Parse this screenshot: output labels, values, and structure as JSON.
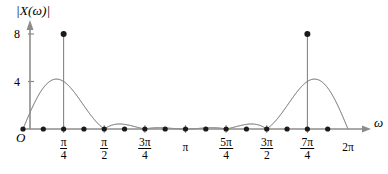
{
  "figure": {
    "title": "",
    "y_axis_label": "|X(ω)|",
    "x_axis_label": "ω",
    "origin_label": "O",
    "colors": {
      "axis": "#8c8c8c",
      "curve": "#4d4d4d",
      "marker": "#1a1a1a",
      "stem": "#7a7a7a",
      "text": "#000000",
      "background": "#ffffff"
    },
    "y_ticks": [
      {
        "label": "8",
        "value": 8
      },
      {
        "label": "4",
        "value": 4
      }
    ],
    "x_ticks": [
      {
        "label_type": "fraction",
        "num": "π",
        "den": "4",
        "value": 0.25
      },
      {
        "label_type": "fraction",
        "num": "π",
        "den": "2",
        "value": 0.5
      },
      {
        "label_type": "fraction",
        "num": "3π",
        "den": "4",
        "value": 0.75
      },
      {
        "label_type": "plain",
        "text": "π",
        "value": 1.0
      },
      {
        "label_type": "fraction",
        "num": "5π",
        "den": "4",
        "value": 1.25
      },
      {
        "label_type": "fraction",
        "num": "3π",
        "den": "2",
        "value": 1.5
      },
      {
        "label_type": "fraction",
        "num": "7π",
        "den": "4",
        "value": 1.75
      },
      {
        "label_type": "plain",
        "text": "2π",
        "value": 2.0
      }
    ]
  },
  "chart_data": {
    "type": "line",
    "title": "",
    "xlabel": "ω",
    "ylabel": "|X(ω)|",
    "xlim": [
      0,
      2.0
    ],
    "ylim": [
      0,
      9.2
    ],
    "grid": false,
    "legend": null,
    "x_unit": "π radians",
    "main_lobe_peaks": [
      {
        "x": 0.25,
        "y": 8,
        "x_label": "π/4"
      },
      {
        "x": 1.75,
        "y": 8,
        "x_label": "7π/4"
      }
    ],
    "zero_crossings_x": [
      0,
      0.125,
      0.375,
      0.5,
      0.625,
      0.75,
      0.875,
      1.0,
      1.125,
      1.25,
      1.375,
      1.5,
      1.625,
      1.875,
      2.0
    ],
    "sidelobe_peaks": [
      {
        "x": 0.0625,
        "y": 1.75
      },
      {
        "x": 0.4375,
        "y": 1.75
      },
      {
        "x": 0.5625,
        "y": 1.3
      },
      {
        "x": 0.6875,
        "y": 1.2
      },
      {
        "x": 0.8125,
        "y": 1.15
      },
      {
        "x": 0.9375,
        "y": 1.1
      },
      {
        "x": 1.0625,
        "y": 1.1
      },
      {
        "x": 1.1875,
        "y": 1.15
      },
      {
        "x": 1.3125,
        "y": 1.2
      },
      {
        "x": 1.4375,
        "y": 1.3
      },
      {
        "x": 1.5625,
        "y": 1.75
      },
      {
        "x": 1.9375,
        "y": 1.75
      }
    ],
    "marker_points_x": [
      0,
      0.125,
      0.25,
      0.375,
      0.5,
      0.625,
      0.75,
      0.875,
      1.0,
      1.125,
      1.25,
      1.375,
      1.5,
      1.625,
      1.75,
      1.875
    ],
    "stems": [
      {
        "x": 0.25,
        "y": 8
      },
      {
        "x": 1.75,
        "y": 8
      }
    ]
  }
}
